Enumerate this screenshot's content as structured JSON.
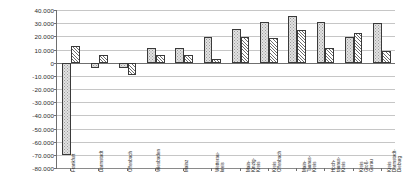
{
  "chart_data": {
    "type": "bar",
    "title": "",
    "subtitle": "",
    "xlabel": "",
    "ylabel": "",
    "grid": true,
    "legend": "none",
    "ylim": [
      -80000,
      40000
    ],
    "ytick_step": 10000,
    "ytick_labels": [
      "40.000",
      "30.000",
      "20.000",
      "10.000",
      "0",
      "-10.000",
      "-20.000",
      "-30.000",
      "-40.000",
      "-50.000",
      "-60.000",
      "-70.000",
      "-80.000"
    ],
    "ytick_values": [
      40000,
      30000,
      20000,
      10000,
      0,
      -10000,
      -20000,
      -30000,
      -40000,
      -50000,
      -60000,
      -70000,
      -80000
    ],
    "categories": [
      "Frankfurt",
      "Darmstadt",
      "Offenbach",
      "Wiesbaden",
      "Mainz",
      "Wetterau-\nkreis",
      "Main-\nKinzig-\nKreis",
      "Kreis\nOffenbach",
      "Main-\nTaunus-\nKreis",
      "Hoch-\ntaunus-\nKreis",
      "Kreis\nGroß-\nGerau",
      "Kreis\nDarmstadt-\nDieburg"
    ],
    "series": [
      {
        "name": "series-1",
        "pattern": "stippled",
        "values": [
          -70000,
          -4000,
          -4000,
          11500,
          11500,
          19500,
          25500,
          31000,
          35500,
          31000,
          19500,
          30500
        ]
      },
      {
        "name": "series-2",
        "pattern": "diagonal-hatch",
        "values": [
          12500,
          5500,
          -9000,
          5500,
          5500,
          2500,
          19500,
          19000,
          24500,
          11000,
          22500,
          8500
        ]
      }
    ]
  }
}
